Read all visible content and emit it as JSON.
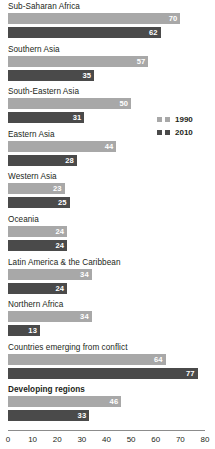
{
  "chart_data": {
    "type": "bar",
    "orientation": "horizontal",
    "title": "",
    "xlabel": "",
    "ylabel": "",
    "xlim": [
      0,
      80
    ],
    "xticks": [
      0,
      10,
      20,
      30,
      40,
      50,
      60,
      70,
      80
    ],
    "grid": false,
    "legend_position": "upper-right",
    "categories": [
      "Sub-Saharan Africa",
      "Southern Asia",
      "South-Eastern Asia",
      "Eastern Asia",
      "Western Asia",
      "Oceania",
      "Latin America & the Caribbean",
      "Northern Africa",
      "Countries emerging from conflict",
      "Developing regions"
    ],
    "emphasized_categories": [
      "Developing regions"
    ],
    "series": [
      {
        "name": "1990",
        "color": "#a8a8a8",
        "values": [
          70,
          57,
          50,
          44,
          23,
          24,
          34,
          34,
          64,
          46
        ]
      },
      {
        "name": "2010",
        "color": "#4a4a4a",
        "values": [
          62,
          35,
          31,
          28,
          25,
          24,
          24,
          13,
          77,
          33
        ]
      }
    ]
  },
  "legend": {
    "entries": [
      {
        "label": "1990",
        "color": "#a8a8a8"
      },
      {
        "label": "2010",
        "color": "#4a4a4a"
      }
    ]
  }
}
